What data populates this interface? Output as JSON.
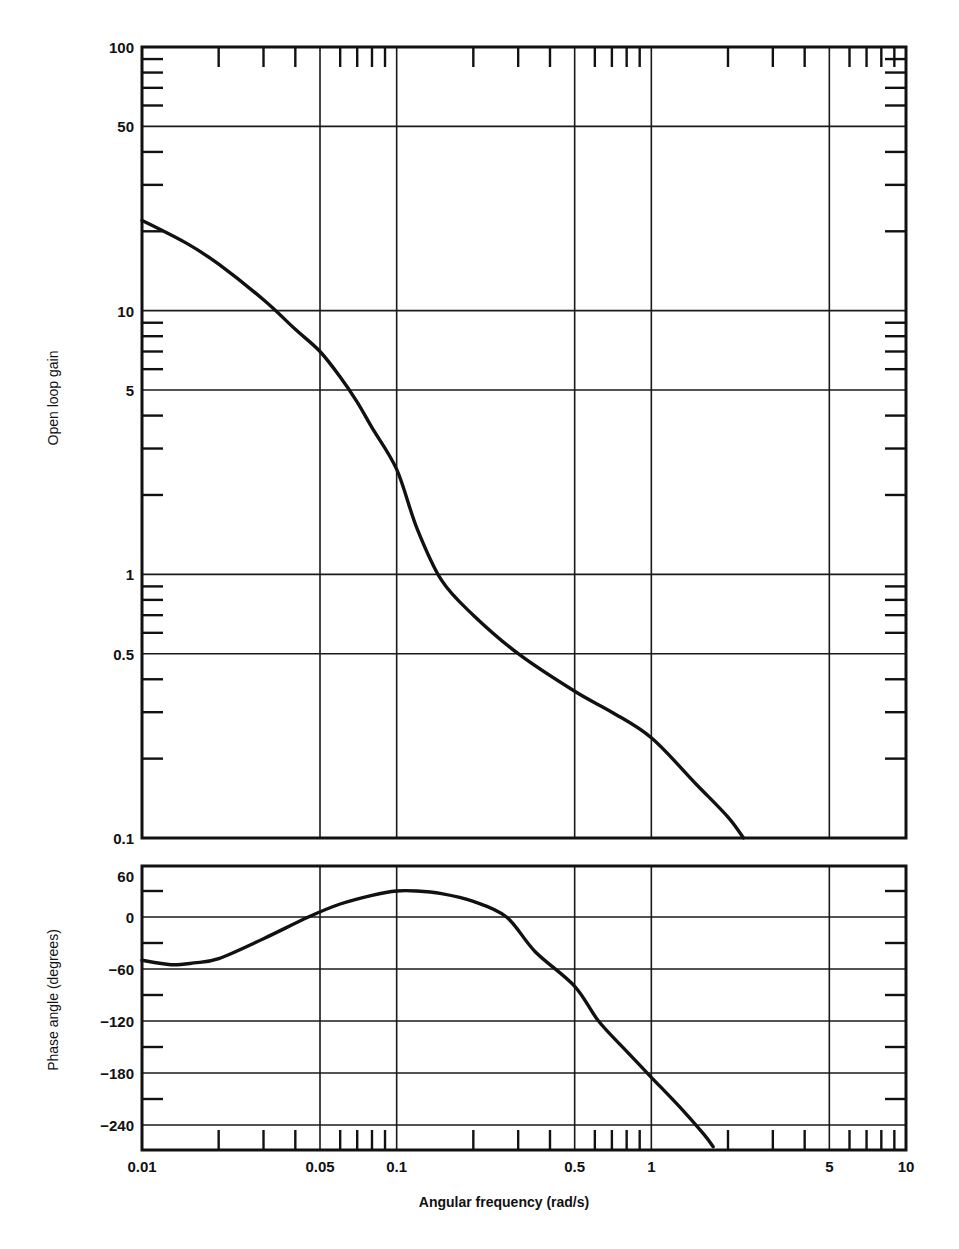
{
  "chart_data": [
    {
      "type": "line",
      "title": "",
      "xlabel": "Angular frequency (rad/s)",
      "ylabel": "Open loop gain",
      "xscale": "log",
      "yscale": "log",
      "xlim": [
        0.01,
        10
      ],
      "ylim": [
        0.1,
        100
      ],
      "grid": true,
      "x_tick_labels": [
        "0.01",
        "0.05",
        "0.1",
        "0.5",
        "1",
        "5",
        "10"
      ],
      "y_tick_labels": [
        "100",
        "50",
        "10",
        "5",
        "1",
        "0.5",
        "0.1"
      ],
      "series": [
        {
          "name": "Open loop gain",
          "x": [
            0.01,
            0.015,
            0.02,
            0.03,
            0.04,
            0.05,
            0.06,
            0.07,
            0.08,
            0.1,
            0.12,
            0.15,
            0.2,
            0.3,
            0.5,
            0.7,
            1.0,
            1.5,
            2.0,
            2.3
          ],
          "y": [
            22,
            18,
            15,
            11,
            8.5,
            7,
            5.6,
            4.5,
            3.6,
            2.5,
            1.5,
            0.95,
            0.7,
            0.5,
            0.36,
            0.3,
            0.24,
            0.16,
            0.12,
            0.1
          ]
        }
      ]
    },
    {
      "type": "line",
      "title": "",
      "xlabel": "Angular frequency (rad/s)",
      "ylabel": "Phase angle (degrees)",
      "xscale": "log",
      "yscale": "linear",
      "xlim": [
        0.01,
        10
      ],
      "ylim": [
        -270,
        60
      ],
      "grid": true,
      "x_tick_labels": [
        "0.01",
        "0.05",
        "0.1",
        "0.5",
        "1",
        "5",
        "10"
      ],
      "y_tick_labels": [
        "60",
        "0",
        "-60",
        "-120",
        "-180",
        "-240"
      ],
      "series": [
        {
          "name": "Phase angle",
          "x": [
            0.01,
            0.013,
            0.016,
            0.02,
            0.03,
            0.045,
            0.06,
            0.08,
            0.1,
            0.12,
            0.15,
            0.2,
            0.27,
            0.35,
            0.5,
            0.62,
            0.8,
            1.0,
            1.3,
            1.6,
            1.75
          ],
          "y": [
            -50,
            -55,
            -53,
            -48,
            -25,
            0,
            15,
            25,
            30,
            30,
            27,
            18,
            0,
            -40,
            -80,
            -120,
            -155,
            -185,
            -220,
            -250,
            -265
          ]
        }
      ]
    }
  ],
  "labels": {
    "gain_ylabel": "Open loop gain",
    "phase_ylabel": "Phase angle (degrees)",
    "xlabel": "Angular frequency (rad/s)",
    "gain_ticks": [
      "100",
      "50",
      "10",
      "5",
      "1",
      "0.5",
      "0.1"
    ],
    "phase_ticks": [
      "60",
      "0",
      "−120",
      "−180",
      "−240"
    ],
    "phase_tick_m60": "−60",
    "x_ticks": [
      "0.01",
      "0.05",
      "0.1",
      "0.5",
      "1",
      "5",
      "10"
    ]
  }
}
